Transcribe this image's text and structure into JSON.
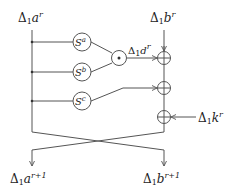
{
  "diagram": {
    "inputs": {
      "left": {
        "delta": "Δ",
        "sub": "1",
        "var": "a",
        "sup": "r"
      },
      "right": {
        "delta": "Δ",
        "sub": "1",
        "var": "b",
        "sup": "r"
      }
    },
    "outputs": {
      "left": {
        "delta": "Δ",
        "sub": "1",
        "var": "a",
        "sup": "r+1"
      },
      "right": {
        "delta": "Δ",
        "sub": "1",
        "var": "b",
        "sup": "r+1"
      }
    },
    "sboxes": [
      {
        "name": "S",
        "sup": "a"
      },
      {
        "name": "S",
        "sup": "b"
      },
      {
        "name": "S",
        "sup": "c"
      }
    ],
    "and_gate": {
      "symbol": "•"
    },
    "intermediate": {
      "delta": "Δ",
      "sub": "1",
      "var": "d",
      "sup": "r"
    },
    "key_input": {
      "delta": "Δ",
      "sub": "1",
      "var": "k",
      "sup": "r"
    },
    "xor_count": 3,
    "colors": {
      "line": "#555555",
      "text": "#222222"
    }
  }
}
